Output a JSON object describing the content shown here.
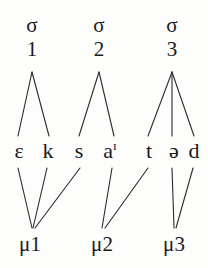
{
  "figure": {
    "type": "prosodic-tree",
    "word_transcription": "ɛksaɪtəd",
    "background_color": "#fdfdfc",
    "line_color": "#2b2b2b",
    "text_color": "#1a1a1a"
  },
  "syllables": [
    {
      "glyph": "σ",
      "index": "1",
      "x": 32,
      "y": 14
    },
    {
      "glyph": "σ",
      "index": "2",
      "x": 99,
      "y": 14
    },
    {
      "glyph": "σ",
      "index": "3",
      "x": 172,
      "y": 14
    }
  ],
  "segments": [
    {
      "symbol": "ɛ",
      "offglide": "",
      "x": 19
    },
    {
      "symbol": "k",
      "offglide": "",
      "x": 48
    },
    {
      "symbol": "s",
      "offglide": "",
      "x": 79
    },
    {
      "symbol": "a",
      "offglide": "ɪ",
      "x": 110
    },
    {
      "symbol": "t",
      "offglide": "",
      "x": 149
    },
    {
      "symbol": "ə",
      "offglide": "",
      "x": 174
    },
    {
      "symbol": "d",
      "offglide": "",
      "x": 194
    }
  ],
  "moras": [
    {
      "glyph": "μ",
      "index": "1",
      "label": "μ1",
      "x": 30
    },
    {
      "glyph": "μ",
      "index": "2",
      "label": "μ2",
      "x": 102
    },
    {
      "glyph": "μ",
      "index": "3",
      "label": "μ3",
      "x": 174
    }
  ],
  "syllable_edges": [
    {
      "from": "σ1",
      "to": "ɛ",
      "x1": 32,
      "y1": 72,
      "x2": 18,
      "y2": 136
    },
    {
      "from": "σ1",
      "to": "k",
      "x1": 32,
      "y1": 72,
      "x2": 49,
      "y2": 136
    },
    {
      "from": "σ2",
      "to": "s",
      "x1": 99,
      "y1": 72,
      "x2": 79,
      "y2": 136
    },
    {
      "from": "σ2",
      "to": "aɪ",
      "x1": 99,
      "y1": 72,
      "x2": 114,
      "y2": 136
    },
    {
      "from": "σ3",
      "to": "t",
      "x1": 172,
      "y1": 72,
      "x2": 148,
      "y2": 136
    },
    {
      "from": "σ3",
      "to": "ə",
      "x1": 172,
      "y1": 72,
      "x2": 172,
      "y2": 136
    },
    {
      "from": "σ3",
      "to": "d",
      "x1": 172,
      "y1": 72,
      "x2": 194,
      "y2": 136
    }
  ],
  "mora_edges": [
    {
      "from": "ɛ",
      "to": "μ1",
      "x1": 18,
      "y1": 168,
      "x2": 32,
      "y2": 228
    },
    {
      "from": "k",
      "to": "μ1",
      "x1": 47,
      "y1": 168,
      "x2": 33,
      "y2": 228
    },
    {
      "from": "s",
      "to": "μ1",
      "x1": 80,
      "y1": 168,
      "x2": 35,
      "y2": 228
    },
    {
      "from": "aɪ",
      "to": "μ2",
      "x1": 112,
      "y1": 168,
      "x2": 102,
      "y2": 228
    },
    {
      "from": "t",
      "to": "μ2",
      "x1": 148,
      "y1": 168,
      "x2": 105,
      "y2": 228
    },
    {
      "from": "ə",
      "to": "μ3",
      "x1": 172,
      "y1": 168,
      "x2": 174,
      "y2": 228
    },
    {
      "from": "d",
      "to": "μ3",
      "x1": 193,
      "y1": 168,
      "x2": 176,
      "y2": 228
    }
  ]
}
